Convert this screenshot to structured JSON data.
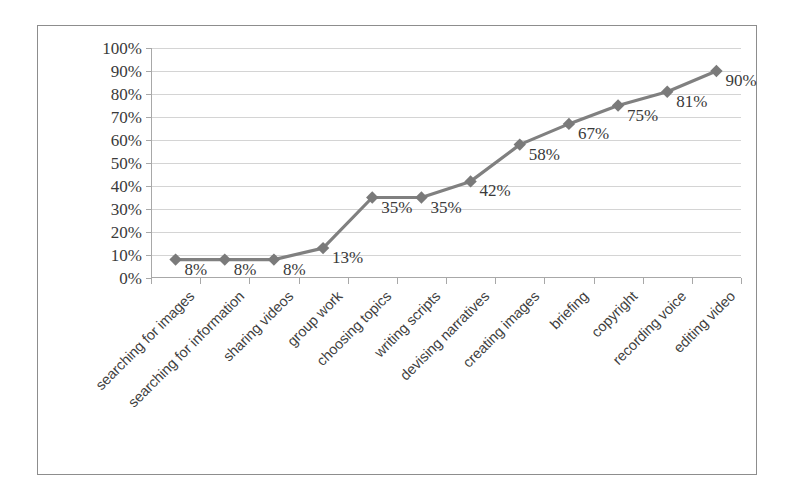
{
  "chart_data": {
    "type": "line",
    "title": "",
    "subtitle": "",
    "xlabel": "",
    "ylabel": "",
    "grid": true,
    "legend": "none",
    "ylim": [
      0,
      100
    ],
    "ytick_labels": [
      "0%",
      "10%",
      "20%",
      "30%",
      "40%",
      "50%",
      "60%",
      "70%",
      "80%",
      "90%",
      "100%"
    ],
    "ytick_values": [
      0,
      10,
      20,
      30,
      40,
      50,
      60,
      70,
      80,
      90,
      100
    ],
    "categories": [
      "searching for images",
      "searching for information",
      "sharing videos",
      "group work",
      "choosing topics",
      "writing scripts",
      "devising narratives",
      "creating images",
      "briefing",
      "copyright",
      "recording voice",
      "editing video"
    ],
    "values": [
      8,
      8,
      8,
      13,
      35,
      35,
      42,
      58,
      67,
      75,
      81,
      90
    ],
    "point_labels": [
      "8%",
      "8%",
      "8%",
      "13%",
      "35%",
      "35%",
      "42%",
      "58%",
      "67%",
      "75%",
      "81%",
      "90%"
    ],
    "series": [
      {
        "name": "",
        "values": [
          8,
          8,
          8,
          13,
          35,
          35,
          42,
          58,
          67,
          75,
          81,
          90
        ],
        "marker": "diamond",
        "line_color": "#808080",
        "marker_color": "#7a7a7a"
      }
    ],
    "colors": {
      "line": "#808080",
      "marker": "#7a7a7a",
      "gridline": "#d4d4d4",
      "axis": "#a8a8a8",
      "frame": "#8d8d8d",
      "text": "#3a3a3a",
      "background": "#ffffff"
    }
  }
}
